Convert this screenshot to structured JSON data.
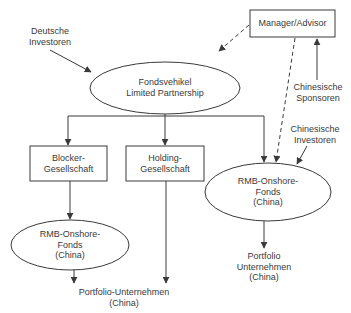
{
  "nodes": {
    "german_investors": {
      "label": "Deutsche\nInvestoren"
    },
    "fund_vehicle": {
      "label": "Fondsvehikel\nLimited Partnership"
    },
    "manager_advisor": {
      "label": "Manager/Advisor"
    },
    "chinese_sponsors": {
      "label": "Chinesische\nSponsoren"
    },
    "chinese_investors": {
      "label": "Chinesische\nInvestoren"
    },
    "blocker_company": {
      "label": "Blocker-\nGesellschaft"
    },
    "holding_company": {
      "label": "Holding-\nGesellschaft"
    },
    "rmb_fund_right": {
      "label": "RMB-Onshore-\nFonds\n(China)"
    },
    "rmb_fund_left": {
      "label": "RMB-Onshore-\nFonds\n(China)"
    },
    "portfolio_right": {
      "label": "Portfolio\nUnternehmen\n(China)"
    },
    "portfolio_bottom": {
      "label": "Portfolio-Unternehmen\n(China)"
    }
  },
  "edges": [
    {
      "from": "german_investors",
      "to": "fund_vehicle",
      "style": "solid"
    },
    {
      "from": "manager_advisor",
      "to": "fund_vehicle",
      "style": "dashed"
    },
    {
      "from": "manager_advisor",
      "to": "rmb_fund_right",
      "style": "dashed"
    },
    {
      "from": "chinese_sponsors",
      "to": "manager_advisor",
      "style": "solid"
    },
    {
      "from": "fund_vehicle",
      "to": "blocker_company",
      "style": "solid"
    },
    {
      "from": "fund_vehicle",
      "to": "holding_company",
      "style": "solid"
    },
    {
      "from": "fund_vehicle",
      "to": "rmb_fund_right",
      "style": "solid"
    },
    {
      "from": "chinese_investors",
      "to": "rmb_fund_right",
      "style": "solid"
    },
    {
      "from": "blocker_company",
      "to": "rmb_fund_left",
      "style": "solid"
    },
    {
      "from": "rmb_fund_left",
      "to": "portfolio_bottom",
      "style": "solid"
    },
    {
      "from": "holding_company",
      "to": "portfolio_bottom",
      "style": "solid"
    },
    {
      "from": "rmb_fund_right",
      "to": "portfolio_right",
      "style": "solid"
    }
  ],
  "colors": {
    "stroke": "#3a3a3a",
    "background": "#ffffff",
    "text": "#3a3a3a"
  }
}
